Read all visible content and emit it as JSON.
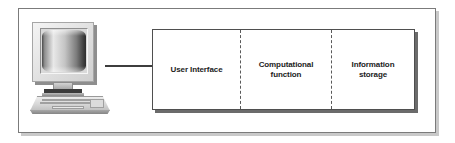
{
  "diagram": {
    "computer": {
      "name": "desktop-computer-illustration",
      "parts": [
        "crt-monitor",
        "monitor-stand",
        "keyboard"
      ]
    },
    "connector": {
      "name": "connector-line",
      "style": "solid",
      "color": "#3d3d3d"
    },
    "panels": [
      {
        "id": "user-interface",
        "label": "User Interface",
        "lines": [
          "User Interface"
        ]
      },
      {
        "id": "computational-function",
        "label": "Computational function",
        "lines": [
          "Computational",
          "function"
        ]
      },
      {
        "id": "information-storage",
        "label": "Information storage",
        "lines": [
          "Information",
          "storage"
        ]
      }
    ],
    "colors": {
      "frame_border": "#7b7b7b",
      "frame_shadow": "#c9c9c9",
      "box_border": "#4f4f4f",
      "box_shadow": "#6b6b6b",
      "divider": "#595959",
      "text": "#1c1c1c",
      "background": "#ffffff"
    }
  }
}
